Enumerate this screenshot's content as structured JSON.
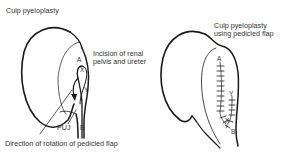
{
  "left_panel": {
    "title": "Culp pyeloplasty",
    "incision_label_line1": "Incision of renal",
    "incision_label_line2": "pelvis and ureter",
    "puj_label": "PUJ",
    "rotation_label": "Direction of rotation of pedicled flap",
    "markers": {
      "a": "A",
      "x": "X",
      "y": "Y",
      "b": "B"
    }
  },
  "right_panel": {
    "title_line1": "Culp pyeloplasty",
    "title_line2": "using pedicled flap",
    "markers": {
      "a": "A",
      "y": "Y",
      "x": "X",
      "b": "B"
    }
  },
  "colors": {
    "line": "#1a1a1a",
    "background": "#ffffff",
    "text": "#333333"
  }
}
